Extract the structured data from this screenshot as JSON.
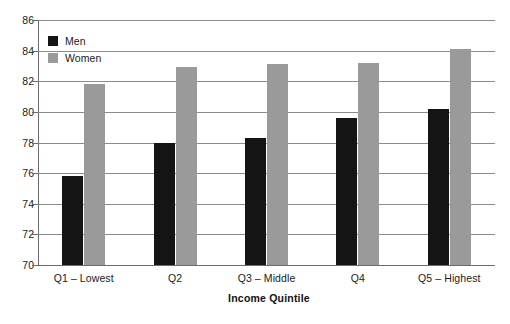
{
  "chart_data": {
    "type": "bar",
    "title": "",
    "subtitle": "",
    "xlabel": "Income Quintile",
    "ylabel": "",
    "categories": [
      "Q1 – Lowest",
      "Q2",
      "Q3 – Middle",
      "Q4",
      "Q5 – Highest"
    ],
    "series": [
      {
        "name": "Men",
        "color": "#141414",
        "values": [
          75.8,
          78.0,
          78.3,
          79.6,
          80.2
        ]
      },
      {
        "name": "Women",
        "color": "#9a9a9a",
        "values": [
          81.8,
          82.9,
          83.1,
          83.2,
          84.1
        ]
      }
    ],
    "ylim": [
      70,
      86
    ],
    "yticks": [
      70,
      72,
      74,
      76,
      78,
      80,
      82,
      84,
      86
    ],
    "ytick_labels": [
      "70",
      "72",
      "74",
      "76",
      "78",
      "80",
      "82",
      "84",
      "86"
    ],
    "grid": true,
    "grid_axis": "y",
    "legend_position": "top-left-inside",
    "legend_entries": [
      "Men",
      "Women"
    ]
  },
  "colors": {
    "men": "#141414",
    "women": "#9a9a9a",
    "gridline": "#8c8c8c",
    "axis": "#6b6b6b",
    "text": "#1a1a1a",
    "background": "#ffffff"
  }
}
